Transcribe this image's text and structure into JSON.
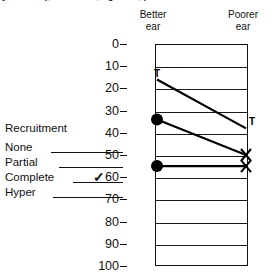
{
  "caption": {
    "clipped_text": "y minutes), tone ones, right ear, pure tone"
  },
  "header": {
    "better_ear_line1": "Better",
    "better_ear_line2": "ear",
    "poorer_ear_line1": "Poorer",
    "poorer_ear_line2": "ear"
  },
  "legend": {
    "title": "Recruitment",
    "items": [
      {
        "label": "None",
        "checked": ""
      },
      {
        "label": "Partial",
        "checked": ""
      },
      {
        "label": "Complete",
        "checked": "✓"
      },
      {
        "label": "Hyper",
        "checked": ""
      }
    ]
  },
  "axis": {
    "ticks": [
      "0",
      "10",
      "20",
      "30",
      "40",
      "50",
      "60",
      "70",
      "80",
      "90",
      "100"
    ]
  },
  "markers": {
    "t_left": "T",
    "t_right": "T"
  },
  "chart_data": {
    "type": "line",
    "title": "",
    "subtitle": "",
    "xlabel": "",
    "ylabel": "",
    "x": [
      "Better ear",
      "Poorer ear"
    ],
    "categories": [
      "Better ear",
      "Poorer ear"
    ],
    "ylim": [
      0,
      100
    ],
    "y_inverted": true,
    "y_ticks": [
      0,
      10,
      20,
      30,
      40,
      50,
      60,
      70,
      80,
      90,
      100
    ],
    "grid": true,
    "legend_position": "left",
    "series": [
      {
        "name": "pair-1",
        "values": [
          16,
          38
        ],
        "left_marker": "T",
        "right_marker": "T"
      },
      {
        "name": "pair-2",
        "values": [
          34,
          50
        ],
        "left_marker": "filled-circle",
        "right_marker": "cross-x"
      },
      {
        "name": "pair-3",
        "values": [
          55,
          55
        ],
        "left_marker": "filled-circle",
        "right_marker": "cross-x"
      }
    ],
    "legend_entries": [
      "None",
      "Partial",
      "Complete",
      "Hyper"
    ],
    "annotations": [
      "Better ear",
      "Poorer ear",
      "Recruitment"
    ]
  },
  "colors": {
    "ink": "#111111",
    "background": "#ffffff"
  }
}
